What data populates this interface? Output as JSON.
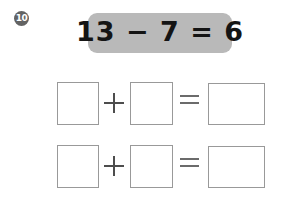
{
  "worksheet": {
    "problem_number": "10",
    "problem_marker_style": "circled-number",
    "background_color": "#ffffff"
  },
  "banner": {
    "equation": "13 − 7 = 6",
    "background_color": "#b9b9b9",
    "text_color": "#141414"
  },
  "rows": [
    {
      "id": "row-0",
      "boxes": [
        "",
        "",
        ""
      ],
      "operators": [
        "+",
        "="
      ]
    },
    {
      "id": "row-1",
      "boxes": [
        "",
        "",
        ""
      ],
      "operators": [
        "+",
        "="
      ]
    }
  ],
  "box_style": {
    "border_color": "#999999",
    "fill_color": "#ffffff"
  }
}
